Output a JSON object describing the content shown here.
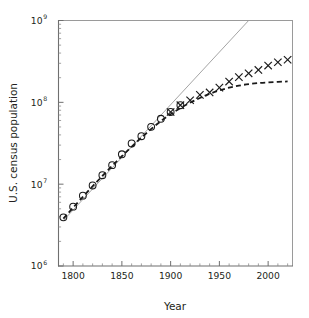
{
  "chart_data": {
    "type": "scatter",
    "title": "",
    "xlabel": "Year",
    "ylabel": "U.S. census population",
    "xlim": [
      1785,
      2025
    ],
    "ylim": [
      1000000,
      1000000000
    ],
    "yscale": "log",
    "xscale": "linear",
    "grid": false,
    "legend": "none",
    "x_ticks_major": [
      1800,
      1850,
      1900,
      1950,
      2000
    ],
    "x_tick_labels": [
      "1800",
      "1850",
      "1900",
      "1950",
      "2000"
    ],
    "x_ticks_minor_step": 10,
    "y_ticks_major": [
      1000000,
      10000000,
      100000000,
      1000000000
    ],
    "y_tick_labels": [
      "10⁶",
      "10⁷",
      "10⁸",
      "10⁹"
    ],
    "y_tick_mantissas": [
      "10",
      "10",
      "10",
      "10"
    ],
    "y_tick_exponents": [
      "6",
      "7",
      "8",
      "9"
    ],
    "series": [
      {
        "name": "census-data-early",
        "marker": "circle",
        "x": [
          1790,
          1800,
          1810,
          1820,
          1830,
          1840,
          1850,
          1860,
          1870,
          1880,
          1890,
          1900,
          1910
        ],
        "y": [
          3929214,
          5308483,
          7239881,
          9638453,
          12866020,
          17069453,
          23191876,
          31443321,
          38558371,
          50189209,
          62979766,
          76212168,
          92228496
        ]
      },
      {
        "name": "census-data-late",
        "marker": "cross",
        "x": [
          1900,
          1910,
          1920,
          1930,
          1940,
          1950,
          1960,
          1970,
          1980,
          1990,
          2000,
          2010,
          2020
        ],
        "y": [
          76212168,
          92228496,
          106021537,
          123202624,
          132164569,
          151325798,
          179323175,
          203211926,
          226545805,
          248709873,
          281421906,
          308745538,
          331449281
        ]
      },
      {
        "name": "exponential-fit",
        "marker": "none",
        "style": "solid-thin-gray",
        "x": [
          1790,
          1980
        ],
        "y": [
          3600000,
          1000000000
        ]
      },
      {
        "name": "logistic-fit",
        "marker": "none",
        "style": "dashed-black",
        "x": [
          1790,
          1810,
          1830,
          1850,
          1870,
          1890,
          1910,
          1930,
          1950,
          1970,
          1990,
          2010,
          2020
        ],
        "y": [
          3800000,
          7000000,
          12600000,
          22000000,
          37000000,
          59000000,
          85000000,
          113000000,
          140000000,
          160000000,
          172000000,
          178000000,
          180000000
        ]
      }
    ]
  },
  "axes": {
    "x_title": "Year",
    "y_title": "U.S. census population"
  }
}
